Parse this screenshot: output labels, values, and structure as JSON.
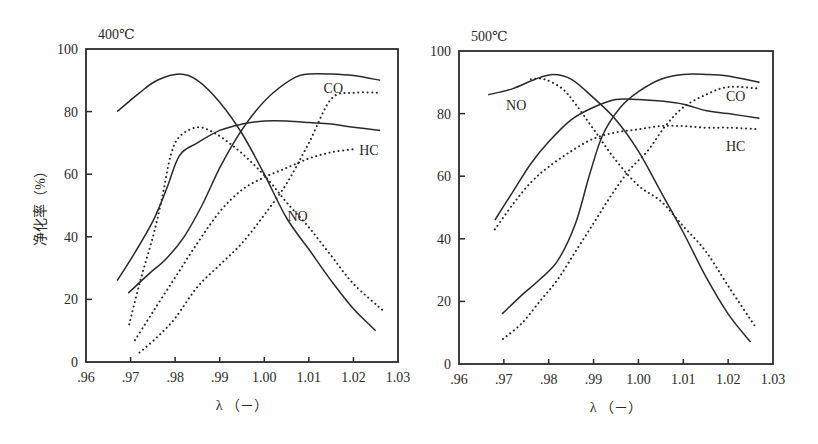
{
  "figure": {
    "ylabel": "净化率（%）",
    "xlabel": "λ （－）"
  },
  "chart_data": [
    {
      "type": "line",
      "title": "400℃",
      "xlabel": "λ （－）",
      "ylabel": "净化率（%）",
      "xlim": [
        0.96,
        1.03
      ],
      "ylim": [
        0,
        100
      ],
      "x_ticks": [
        ".96",
        ".97",
        ".98",
        ".99",
        "1.00",
        "1.01",
        "1.02",
        "1.03"
      ],
      "y_ticks": [
        "0",
        "20",
        "40",
        "60",
        "80",
        "100"
      ],
      "grid": false,
      "annotations": [
        {
          "text": "CO",
          "x": 1.0133,
          "y": 86
        },
        {
          "text": "HC",
          "x": 1.0213,
          "y": 66
        },
        {
          "text": "NO",
          "x": 1.0052,
          "y": 45
        }
      ],
      "series": [
        {
          "name": "NO",
          "style": "solid",
          "points": [
            [
              0.967,
              80
            ],
            [
              0.972,
              86
            ],
            [
              0.976,
              90
            ],
            [
              0.981,
              92
            ],
            [
              0.985,
              90
            ],
            [
              0.99,
              83
            ],
            [
              0.995,
              73
            ],
            [
              1.0,
              60
            ],
            [
              1.005,
              46
            ],
            [
              1.01,
              36
            ],
            [
              1.015,
              26
            ],
            [
              1.02,
              17
            ],
            [
              1.025,
              10
            ]
          ]
        },
        {
          "name": "HC",
          "style": "solid",
          "points": [
            [
              0.967,
              26
            ],
            [
              0.971,
              35
            ],
            [
              0.975,
              45
            ],
            [
              0.978,
              55
            ],
            [
              0.981,
              66
            ],
            [
              0.985,
              70
            ],
            [
              0.99,
              74
            ],
            [
              0.995,
              76
            ],
            [
              1.0,
              77
            ],
            [
              1.005,
              77
            ],
            [
              1.01,
              76.5
            ],
            [
              1.015,
              76
            ],
            [
              1.02,
              75
            ],
            [
              1.026,
              74
            ]
          ]
        },
        {
          "name": "CO",
          "style": "solid",
          "points": [
            [
              0.9695,
              22
            ],
            [
              0.974,
              28
            ],
            [
              0.978,
              33
            ],
            [
              0.982,
              40
            ],
            [
              0.986,
              50
            ],
            [
              0.99,
              62
            ],
            [
              0.994,
              72
            ],
            [
              0.998,
              80
            ],
            [
              1.002,
              86
            ],
            [
              1.007,
              91
            ],
            [
              1.01,
              92
            ],
            [
              1.015,
              92
            ],
            [
              1.02,
              91.5
            ],
            [
              1.026,
              90
            ]
          ]
        },
        {
          "name": "NO",
          "style": "dotted",
          "points": [
            [
              0.9697,
              12
            ],
            [
              0.972,
              25
            ],
            [
              0.975,
              40
            ],
            [
              0.977,
              52
            ],
            [
              0.979,
              66
            ],
            [
              0.981,
              72
            ],
            [
              0.985,
              75
            ],
            [
              0.989,
              73
            ],
            [
              0.993,
              69
            ],
            [
              0.997,
              64
            ],
            [
              1.001,
              58
            ],
            [
              1.005,
              51
            ],
            [
              1.01,
              43
            ],
            [
              1.015,
              34
            ],
            [
              1.02,
              25
            ],
            [
              1.027,
              16
            ]
          ]
        },
        {
          "name": "HC",
          "style": "dotted",
          "points": [
            [
              0.971,
              7
            ],
            [
              0.975,
              16
            ],
            [
              0.98,
              27
            ],
            [
              0.985,
              38
            ],
            [
              0.99,
              48
            ],
            [
              0.995,
              55
            ],
            [
              1.0,
              59
            ],
            [
              1.005,
              62
            ],
            [
              1.01,
              65
            ],
            [
              1.015,
              67
            ],
            [
              1.02,
              68
            ]
          ]
        },
        {
          "name": "CO",
          "style": "dotted",
          "points": [
            [
              0.972,
              3
            ],
            [
              0.976,
              8
            ],
            [
              0.98,
              14
            ],
            [
              0.985,
              24
            ],
            [
              0.99,
              31
            ],
            [
              0.995,
              38
            ],
            [
              1.0,
              47
            ],
            [
              1.005,
              57
            ],
            [
              1.01,
              70
            ],
            [
              1.015,
              84
            ],
            [
              1.02,
              86
            ],
            [
              1.026,
              86
            ]
          ]
        }
      ]
    },
    {
      "type": "line",
      "title": "500℃",
      "xlabel": "λ （－）",
      "ylabel": "",
      "xlim": [
        0.96,
        1.03
      ],
      "ylim": [
        0,
        100
      ],
      "x_ticks": [
        ".96",
        ".97",
        ".98",
        ".99",
        "1.00",
        "1.01",
        "1.02",
        "1.03"
      ],
      "y_ticks": [
        "0",
        "20",
        "40",
        "60",
        "80",
        "100"
      ],
      "grid": false,
      "annotations": [
        {
          "text": "NO",
          "x": 0.9705,
          "y": 81
        },
        {
          "text": "CO",
          "x": 1.0195,
          "y": 84
        },
        {
          "text": "HC",
          "x": 1.0195,
          "y": 68
        }
      ],
      "series": [
        {
          "name": "NO",
          "style": "solid",
          "points": [
            [
              0.9665,
              86
            ],
            [
              0.972,
              88
            ],
            [
              0.977,
              91
            ],
            [
              0.981,
              92.5
            ],
            [
              0.985,
              91
            ],
            [
              0.99,
              85
            ],
            [
              0.995,
              78
            ],
            [
              1.0,
              68
            ],
            [
              1.005,
              55
            ],
            [
              1.01,
              42
            ],
            [
              1.015,
              28
            ],
            [
              1.02,
              16
            ],
            [
              1.025,
              7
            ]
          ]
        },
        {
          "name": "HC",
          "style": "solid",
          "points": [
            [
              0.968,
              46
            ],
            [
              0.972,
              55
            ],
            [
              0.976,
              64
            ],
            [
              0.98,
              71
            ],
            [
              0.985,
              78
            ],
            [
              0.99,
              82
            ],
            [
              0.995,
              84.5
            ],
            [
              1.0,
              84.5
            ],
            [
              1.005,
              84
            ],
            [
              1.01,
              83
            ],
            [
              1.015,
              81
            ],
            [
              1.02,
              80
            ],
            [
              1.027,
              78.5
            ]
          ]
        },
        {
          "name": "CO",
          "style": "solid",
          "points": [
            [
              0.9696,
              16
            ],
            [
              0.974,
              22
            ],
            [
              0.978,
              27
            ],
            [
              0.982,
              33
            ],
            [
              0.986,
              45
            ],
            [
              0.989,
              60
            ],
            [
              0.992,
              73
            ],
            [
              0.996,
              82
            ],
            [
              1.0,
              87
            ],
            [
              1.005,
              91
            ],
            [
              1.01,
              92.5
            ],
            [
              1.015,
              92.5
            ],
            [
              1.02,
              92
            ],
            [
              1.027,
              90
            ]
          ]
        },
        {
          "name": "NO",
          "style": "dotted",
          "points": [
            [
              0.976,
              91
            ],
            [
              0.979,
              91
            ],
            [
              0.983,
              88
            ],
            [
              0.986,
              83
            ],
            [
              0.99,
              75
            ],
            [
              0.995,
              65
            ],
            [
              1.0,
              57
            ],
            [
              1.005,
              52
            ],
            [
              1.01,
              44
            ],
            [
              1.015,
              36
            ],
            [
              1.02,
              25
            ],
            [
              1.026,
              12
            ]
          ]
        },
        {
          "name": "HC",
          "style": "dotted",
          "points": [
            [
              0.968,
              43
            ],
            [
              0.972,
              51
            ],
            [
              0.976,
              58
            ],
            [
              0.98,
              63
            ],
            [
              0.985,
              68
            ],
            [
              0.99,
              72
            ],
            [
              0.995,
              74
            ],
            [
              1.0,
              75
            ],
            [
              1.005,
              76
            ],
            [
              1.01,
              76
            ],
            [
              1.015,
              75.5
            ],
            [
              1.02,
              75.5
            ],
            [
              1.027,
              75
            ]
          ]
        },
        {
          "name": "CO",
          "style": "dotted",
          "points": [
            [
              0.9698,
              8
            ],
            [
              0.974,
              13
            ],
            [
              0.978,
              20
            ],
            [
              0.982,
              27
            ],
            [
              0.986,
              36
            ],
            [
              0.99,
              45
            ],
            [
              0.994,
              54
            ],
            [
              0.998,
              62
            ],
            [
              1.002,
              68
            ],
            [
              1.006,
              76
            ],
            [
              1.01,
              82
            ],
            [
              1.015,
              86
            ],
            [
              1.02,
              88.5
            ],
            [
              1.027,
              88
            ]
          ]
        }
      ]
    }
  ],
  "layout": {
    "panels": [
      {
        "left": 86,
        "top": 49,
        "right": 398,
        "bottom": 362
      },
      {
        "left": 459,
        "top": 51,
        "right": 773,
        "bottom": 364
      }
    ],
    "line_color": "#2a2a2a"
  }
}
